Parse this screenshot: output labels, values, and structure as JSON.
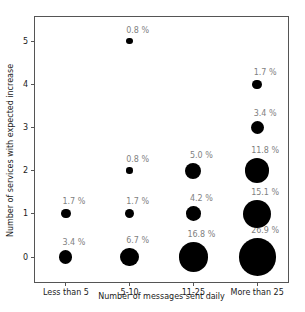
{
  "chart_data": {
    "type": "scatter",
    "subtype": "bubble",
    "title": "",
    "xlabel": "Number of messages sent daily",
    "ylabel": "Number of services with expected increase",
    "categories": [
      "Less than 5",
      "5-10",
      "11-25",
      "More than 25"
    ],
    "y_ticks": [
      "0",
      "1",
      "2",
      "3",
      "4",
      "5"
    ],
    "ylim": [
      -0.6,
      5.6
    ],
    "grid": false,
    "legend": "none",
    "bubble_area_proportional_to_percent": true,
    "points": [
      {
        "category": "Less than 5",
        "x": 0,
        "y": 0,
        "value_pct": 3.4,
        "label": "3.4 %"
      },
      {
        "category": "Less than 5",
        "x": 0,
        "y": 1,
        "value_pct": 1.7,
        "label": "1.7 %"
      },
      {
        "category": "5-10",
        "x": 1,
        "y": 0,
        "value_pct": 6.7,
        "label": "6.7 %"
      },
      {
        "category": "5-10",
        "x": 1,
        "y": 1,
        "value_pct": 1.7,
        "label": "1.7 %"
      },
      {
        "category": "5-10",
        "x": 1,
        "y": 2,
        "value_pct": 0.8,
        "label": "0.8 %"
      },
      {
        "category": "5-10",
        "x": 1,
        "y": 5,
        "value_pct": 0.8,
        "label": "0.8 %"
      },
      {
        "category": "11-25",
        "x": 2,
        "y": 0,
        "value_pct": 16.8,
        "label": "16.8 %"
      },
      {
        "category": "11-25",
        "x": 2,
        "y": 1,
        "value_pct": 4.2,
        "label": "4.2 %"
      },
      {
        "category": "11-25",
        "x": 2,
        "y": 2,
        "value_pct": 5.0,
        "label": "5.0 %"
      },
      {
        "category": "More than 25",
        "x": 3,
        "y": 0,
        "value_pct": 26.9,
        "label": "26.9 %"
      },
      {
        "category": "More than 25",
        "x": 3,
        "y": 1,
        "value_pct": 15.1,
        "label": "15.1 %"
      },
      {
        "category": "More than 25",
        "x": 3,
        "y": 2,
        "value_pct": 11.8,
        "label": "11.8 %"
      },
      {
        "category": "More than 25",
        "x": 3,
        "y": 3,
        "value_pct": 3.4,
        "label": "3.4 %"
      },
      {
        "category": "More than 25",
        "x": 3,
        "y": 4,
        "value_pct": 1.7,
        "label": "1.7 %"
      }
    ],
    "colors": {
      "bubble": "#000000",
      "annotation": "#7f7f7f",
      "axis": "#555555",
      "text": "#1a1a1a",
      "background": "#ffffff"
    }
  }
}
